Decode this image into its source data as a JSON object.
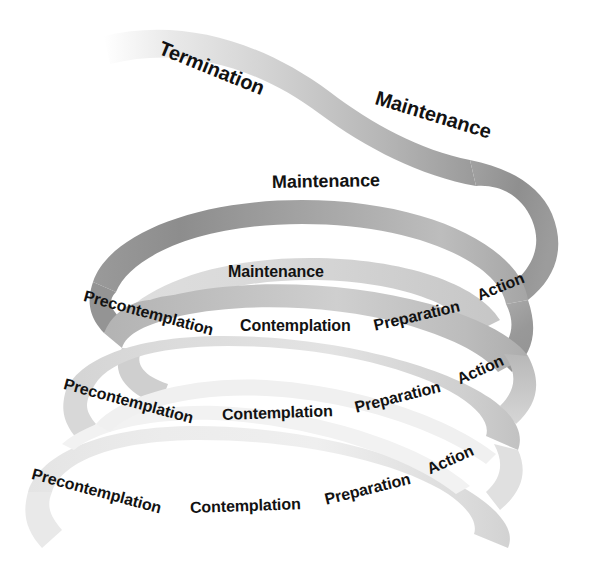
{
  "diagram": {
    "name": "spiral-model-of-change",
    "background_color": "#ffffff",
    "band_colors": {
      "dark_gray": "#8d8d8d",
      "mid_gray": "#a8a8a8",
      "light_gray": "#c9c9c9",
      "pale_gray": "#e2e2e2",
      "very_pale_gray": "#efefef",
      "text_color": "#121212"
    },
    "stages": [
      "Precontemplation",
      "Contemplation",
      "Preparation",
      "Action",
      "Maintenance",
      "Termination"
    ],
    "turns": [
      {
        "id": "turn-top",
        "labels": [
          "Termination",
          "Maintenance"
        ]
      },
      {
        "id": "turn-second",
        "labels": [
          "Maintenance"
        ]
      },
      {
        "id": "turn-third",
        "labels": [
          "Maintenance",
          "Precontemplation",
          "Contemplation",
          "Preparation",
          "Action"
        ]
      },
      {
        "id": "turn-fourth",
        "labels": [
          "Precontemplation",
          "Contemplation",
          "Preparation",
          "Action"
        ]
      },
      {
        "id": "turn-bottom",
        "labels": [
          "Precontemplation",
          "Contemplation",
          "Preparation",
          "Action"
        ]
      }
    ]
  },
  "labels": {
    "termination_top": "Termination",
    "maintenance_top": "Maintenance",
    "maintenance_second": "Maintenance",
    "maintenance_third": "Maintenance",
    "precontemplation_third": "Precontemplation",
    "contemplation_third": "Contemplation",
    "preparation_third": "Preparation",
    "action_third": "Action",
    "precontemplation_fourth": "Precontemplation",
    "contemplation_fourth": "Contemplation",
    "preparation_fourth": "Preparation",
    "action_fourth": "Action",
    "precontemplation_bottom": "Precontemplation",
    "contemplation_bottom": "Contemplation",
    "preparation_bottom": "Preparation",
    "action_bottom": "Action"
  }
}
